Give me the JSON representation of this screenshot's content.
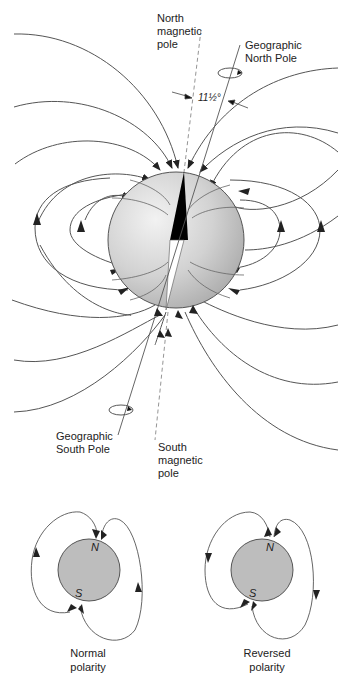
{
  "labels": {
    "north_magnetic_pole": "North\nmagnetic\npole",
    "geographic_north_pole": "Geographic\nNorth Pole",
    "angle": "11½°",
    "geographic_south_pole": "Geographic\nSouth Pole",
    "south_magnetic_pole": "South\nmagnetic\npole"
  },
  "insets": [
    {
      "caption": "Normal\npolarity",
      "north": "N",
      "south": "S"
    },
    {
      "caption": "Reversed\npolarity",
      "north": "N",
      "south": "S"
    }
  ],
  "colors": {
    "line": "#555555",
    "earth_light": "#ececec",
    "earth_dark": "#b5b5b5",
    "inset_fill": "#bdbdbd",
    "magnet": "#000000"
  }
}
